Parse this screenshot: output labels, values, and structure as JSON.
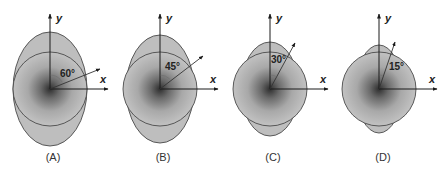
{
  "figure": {
    "colors": {
      "fill": "#bebebe",
      "outline": "#4a4a4a",
      "center_dark": "#2e2e2e",
      "axis": "#1a1a1a"
    },
    "panels": [
      {
        "id": "A",
        "label": "(A)",
        "angle_label": "60°",
        "angle_deg": 60,
        "axis_y_label": "y",
        "axis_x_label": "x",
        "cx": 50,
        "cy": 89,
        "circle_r": 37,
        "ellipse_rx": 37,
        "ellipse_ry": 57,
        "arrow_tip": [
          100,
          69
        ],
        "angle_label_pos": [
          60,
          77
        ],
        "label_x": 53
      },
      {
        "id": "B",
        "label": "(B)",
        "angle_label": "45°",
        "angle_deg": 45,
        "axis_y_label": "y",
        "axis_x_label": "x",
        "cx": 160,
        "cy": 89,
        "circle_r": 37,
        "ellipse_rx": 34,
        "ellipse_ry": 54,
        "arrow_tip": [
          203,
          56
        ],
        "angle_label_pos": [
          165,
          70
        ],
        "label_x": 163
      },
      {
        "id": "C",
        "label": "(C)",
        "angle_label": "30°",
        "angle_deg": 30,
        "axis_y_label": "y",
        "axis_x_label": "x",
        "cx": 270,
        "cy": 89,
        "circle_r": 37,
        "ellipse_rx": 29,
        "ellipse_ry": 47,
        "arrow_tip": [
          295,
          43
        ],
        "angle_label_pos": [
          271,
          63
        ],
        "label_x": 273
      },
      {
        "id": "D",
        "label": "(D)",
        "angle_label": "15°",
        "angle_deg": 15,
        "axis_y_label": "y",
        "axis_x_label": "x",
        "cx": 379,
        "cy": 89,
        "circle_r": 37,
        "ellipse_rx": 23,
        "ellipse_ry": 44,
        "arrow_tip": [
          395,
          42
        ],
        "angle_label_pos": [
          389,
          70
        ],
        "label_x": 383
      }
    ]
  }
}
